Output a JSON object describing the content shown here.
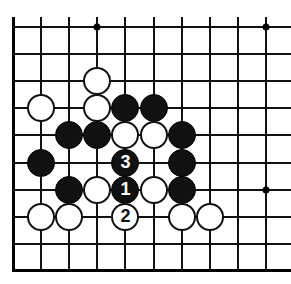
{
  "figure": {
    "kind": "go-board-diagram",
    "board": {
      "columns": 10,
      "rows": 10,
      "origin_x": 13,
      "origin_y": 27,
      "col_spacing": 28.1,
      "row_spacing": 27.1,
      "stone_diameter": 28,
      "line_color": "#111111",
      "edge_color": "#000000",
      "background_color": "#ffffff",
      "left_edge_is_board_border": true,
      "bottom_edge_is_board_border": true,
      "right_edge_is_cropped": true,
      "top_edge_is_cropped": true
    },
    "star_points": [
      {
        "col": 4,
        "row": 1
      },
      {
        "col": 10,
        "row": 1
      },
      {
        "col": 10,
        "row": 7
      }
    ],
    "stones": [
      {
        "col": 4,
        "row": 3,
        "color": "white",
        "label": ""
      },
      {
        "col": 2,
        "row": 4,
        "color": "white",
        "label": ""
      },
      {
        "col": 4,
        "row": 4,
        "color": "white",
        "label": ""
      },
      {
        "col": 5,
        "row": 4,
        "color": "black",
        "label": ""
      },
      {
        "col": 6,
        "row": 4,
        "color": "black",
        "label": ""
      },
      {
        "col": 3,
        "row": 5,
        "color": "black",
        "label": ""
      },
      {
        "col": 4,
        "row": 5,
        "color": "black",
        "label": ""
      },
      {
        "col": 5,
        "row": 5,
        "color": "white",
        "label": ""
      },
      {
        "col": 6,
        "row": 5,
        "color": "white",
        "label": ""
      },
      {
        "col": 7,
        "row": 5,
        "color": "black",
        "label": ""
      },
      {
        "col": 2,
        "row": 6,
        "color": "black",
        "label": ""
      },
      {
        "col": 5,
        "row": 6,
        "color": "black",
        "label": "3"
      },
      {
        "col": 7,
        "row": 6,
        "color": "black",
        "label": ""
      },
      {
        "col": 3,
        "row": 7,
        "color": "black",
        "label": ""
      },
      {
        "col": 4,
        "row": 7,
        "color": "white",
        "label": ""
      },
      {
        "col": 5,
        "row": 7,
        "color": "black",
        "label": "1"
      },
      {
        "col": 6,
        "row": 7,
        "color": "white",
        "label": ""
      },
      {
        "col": 7,
        "row": 7,
        "color": "black",
        "label": ""
      },
      {
        "col": 2,
        "row": 8,
        "color": "white",
        "label": ""
      },
      {
        "col": 3,
        "row": 8,
        "color": "white",
        "label": ""
      },
      {
        "col": 5,
        "row": 8,
        "color": "white",
        "label": "2"
      },
      {
        "col": 7,
        "row": 8,
        "color": "white",
        "label": ""
      },
      {
        "col": 8,
        "row": 8,
        "color": "white",
        "label": ""
      }
    ],
    "move_sequence": [
      {
        "number": "1",
        "color": "black",
        "col": 5,
        "row": 7
      },
      {
        "number": "2",
        "color": "white",
        "col": 5,
        "row": 8
      },
      {
        "number": "3",
        "color": "black",
        "col": 5,
        "row": 6
      }
    ]
  }
}
